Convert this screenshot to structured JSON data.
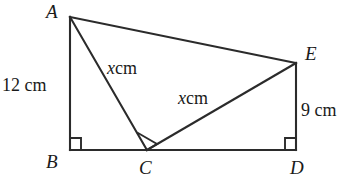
{
  "figure": {
    "stroke_color": "#2b2b2b",
    "text_color": "#1a1a1a",
    "background_color": "#ffffff",
    "vertices": [
      {
        "name": "A",
        "label": "A",
        "x": 70,
        "y": 17
      },
      {
        "name": "B",
        "label": "B",
        "x": 70,
        "y": 150
      },
      {
        "name": "C",
        "label": "C",
        "x": 147,
        "y": 150
      },
      {
        "name": "D",
        "label": "D",
        "x": 296,
        "y": 150
      },
      {
        "name": "E",
        "label": "E",
        "x": 296,
        "y": 63
      }
    ],
    "vertex_labels": [
      {
        "key": "A",
        "text": "A",
        "left": 46,
        "top": 2
      },
      {
        "key": "B",
        "text": "B",
        "left": 46,
        "top": 152
      },
      {
        "key": "C",
        "text": "C",
        "left": 139,
        "top": 158
      },
      {
        "key": "D",
        "text": "D",
        "left": 290,
        "top": 158
      },
      {
        "key": "E",
        "text": "E",
        "left": 305,
        "top": 44
      }
    ],
    "segments": [
      {
        "name": "segment-AB",
        "from": "A",
        "to": "B"
      },
      {
        "name": "segment-BD",
        "from": "B",
        "to": "D"
      },
      {
        "name": "segment-ED",
        "from": "E",
        "to": "D"
      },
      {
        "name": "segment-AE",
        "from": "A",
        "to": "E"
      },
      {
        "name": "segment-AC",
        "from": "A",
        "to": "C"
      },
      {
        "name": "segment-CE",
        "from": "C",
        "to": "E"
      }
    ],
    "right_angles": [
      {
        "name": "right-angle-B",
        "at": "B"
      },
      {
        "name": "right-angle-C",
        "at": "C"
      },
      {
        "name": "right-angle-D",
        "at": "D"
      }
    ],
    "measurements": {
      "ab": {
        "text": "12 cm",
        "left": 2,
        "top": 76
      },
      "ed": {
        "text": "9 cm",
        "left": 301,
        "top": 101
      },
      "ac": {
        "variable": "x",
        "unit": "cm",
        "left": 107,
        "top": 59
      },
      "ce": {
        "variable": "x",
        "unit": "cm",
        "left": 178,
        "top": 89
      }
    }
  }
}
